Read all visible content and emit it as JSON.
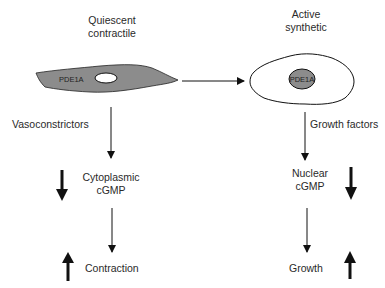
{
  "diagram": {
    "left_column": {
      "title_line1": "Quiescent",
      "title_line2": "contractile",
      "cell_label": "PDE1A",
      "stimulus": "Vasoconstrictors",
      "mediator_line1": "Cytoplasmic",
      "mediator_line2": "cGMP",
      "outcome": "Contraction",
      "mediator_change": "decrease",
      "outcome_change": "increase"
    },
    "right_column": {
      "title_line1": "Active",
      "title_line2": "synthetic",
      "cell_label": "PDE1A",
      "stimulus": "Growth factors",
      "mediator_line1": "Nuclear",
      "mediator_line2": "cGMP",
      "outcome": "Growth",
      "mediator_change": "decrease",
      "outcome_change": "increase"
    },
    "transition": "quiescent-to-synthetic",
    "colors": {
      "cell_fill": "#8c8c8c",
      "nucleus_fill": "#8c8c8c",
      "stroke": "#111111",
      "background": "#ffffff"
    }
  }
}
